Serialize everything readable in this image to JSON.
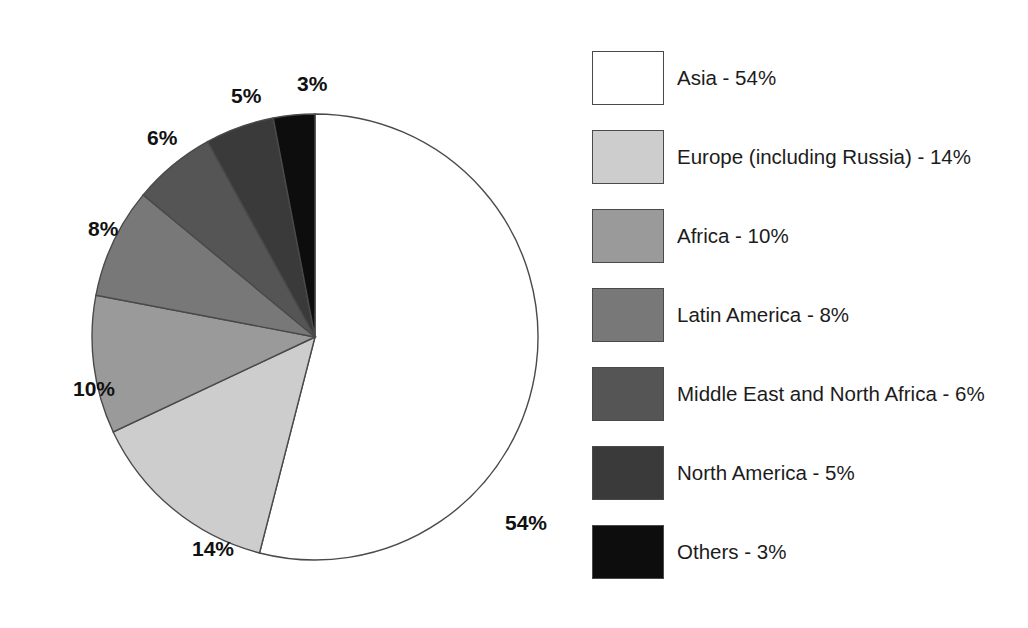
{
  "chart_data": {
    "type": "pie",
    "title": "",
    "subtitle": "",
    "xlabel": "",
    "ylabel": "",
    "grid": false,
    "legend_position": "right",
    "start_angle_deg": 0,
    "direction": "clockwise",
    "units": "percent",
    "total": 100,
    "categories": [
      "Asia",
      "Europe (including Russia)",
      "Africa",
      "Latin America",
      "Middle East and North Africa",
      "North America",
      "Others"
    ],
    "values": [
      54,
      14,
      10,
      8,
      6,
      5,
      3
    ],
    "colors": [
      "#ffffff",
      "#cdcdcd",
      "#9a9a9a",
      "#787878",
      "#555555",
      "#3a3a3a",
      "#0d0d0d"
    ],
    "slices": [
      {
        "name": "Asia",
        "value": 54,
        "label": "54%",
        "color": "#ffffff",
        "legend_text": "Asia - 54%",
        "label_x": 505,
        "label_y": 512
      },
      {
        "name": "Europe (including Russia)",
        "value": 14,
        "label": "14%",
        "color": "#cdcdcd",
        "legend_text": "Europe (including Russia) - 14%",
        "label_x": 192,
        "label_y": 538
      },
      {
        "name": "Africa",
        "value": 10,
        "label": "10%",
        "color": "#9a9a9a",
        "legend_text": "Africa - 10%",
        "label_x": 73,
        "label_y": 378
      },
      {
        "name": "Latin America",
        "value": 8,
        "label": "8%",
        "color": "#787878",
        "legend_text": "Latin America - 8%",
        "label_x": 88,
        "label_y": 218
      },
      {
        "name": "Middle East and North Africa",
        "value": 6,
        "label": "6%",
        "color": "#555555",
        "legend_text": "Middle East and North Africa - 6%",
        "label_x": 147,
        "label_y": 127
      },
      {
        "name": "North America",
        "value": 5,
        "label": "5%",
        "color": "#3a3a3a",
        "legend_text": "North America - 5%",
        "label_x": 231,
        "label_y": 85
      },
      {
        "name": "Others",
        "value": 3,
        "label": "3%",
        "color": "#0d0d0d",
        "legend_text": "Others - 3%",
        "label_x": 297,
        "label_y": 73
      }
    ],
    "geometry": {
      "center_x": 315,
      "center_y": 337,
      "radius": 223,
      "outline_color": "#4a4a4a"
    }
  },
  "legend": {
    "items": [
      {
        "label": "Asia - 54%",
        "color": "#ffffff"
      },
      {
        "label": "Europe (including Russia) - 14%",
        "color": "#cdcdcd"
      },
      {
        "label": "Africa - 10%",
        "color": "#9a9a9a"
      },
      {
        "label": "Latin America - 8%",
        "color": "#787878"
      },
      {
        "label": "Middle East and North Africa - 6%",
        "color": "#555555"
      },
      {
        "label": "North America - 5%",
        "color": "#3a3a3a"
      },
      {
        "label": "Others - 3%",
        "color": "#0d0d0d"
      }
    ]
  }
}
